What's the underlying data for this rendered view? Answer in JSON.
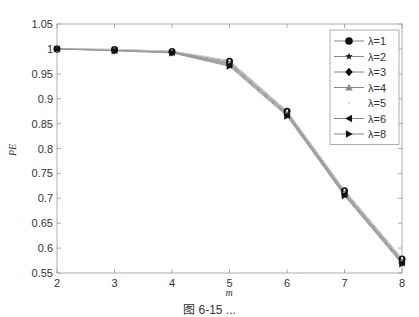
{
  "chart_data": {
    "type": "line",
    "title": "",
    "xlabel": "m",
    "ylabel": "PE",
    "x": [
      2,
      3,
      4,
      5,
      6,
      7,
      8
    ],
    "xlim": [
      2,
      8
    ],
    "ylim": [
      0.55,
      1.05
    ],
    "xticks": [
      "2",
      "3",
      "4",
      "5",
      "6",
      "7",
      "8"
    ],
    "yticks": [
      "0.55",
      "0.6",
      "0.65",
      "0.7",
      "0.75",
      "0.8",
      "0.85",
      "0.9",
      "0.95",
      "1",
      "1.05"
    ],
    "grid": false,
    "legend_position": "upper right",
    "series": [
      {
        "name": "λ=1",
        "marker": "circle",
        "color": "#111111",
        "values": [
          1.0,
          0.999,
          0.995,
          0.975,
          0.875,
          0.715,
          0.578
        ]
      },
      {
        "name": "λ=2",
        "marker": "star",
        "color": "#222222",
        "values": [
          1.0,
          0.998,
          0.994,
          0.972,
          0.872,
          0.712,
          0.575
        ]
      },
      {
        "name": "λ=3",
        "marker": "diamond",
        "color": "#111111",
        "values": [
          1.0,
          0.997,
          0.993,
          0.969,
          0.869,
          0.709,
          0.572
        ]
      },
      {
        "name": "λ=4",
        "marker": "triangle-up",
        "color": "#888888",
        "values": [
          1.0,
          0.998,
          0.994,
          0.971,
          0.871,
          0.711,
          0.574
        ]
      },
      {
        "name": "λ=5",
        "marker": "point",
        "color": "#dddddd",
        "values": [
          1.0,
          0.999,
          0.996,
          0.977,
          0.876,
          0.717,
          0.58
        ]
      },
      {
        "name": "λ=6",
        "marker": "triangle-left",
        "color": "#111111",
        "values": [
          1.0,
          0.997,
          0.993,
          0.967,
          0.867,
          0.707,
          0.57
        ]
      },
      {
        "name": "λ=8",
        "marker": "triangle-right",
        "color": "#111111",
        "values": [
          1.0,
          0.996,
          0.992,
          0.965,
          0.865,
          0.705,
          0.568
        ]
      }
    ]
  },
  "caption": "图 6-15  ..."
}
